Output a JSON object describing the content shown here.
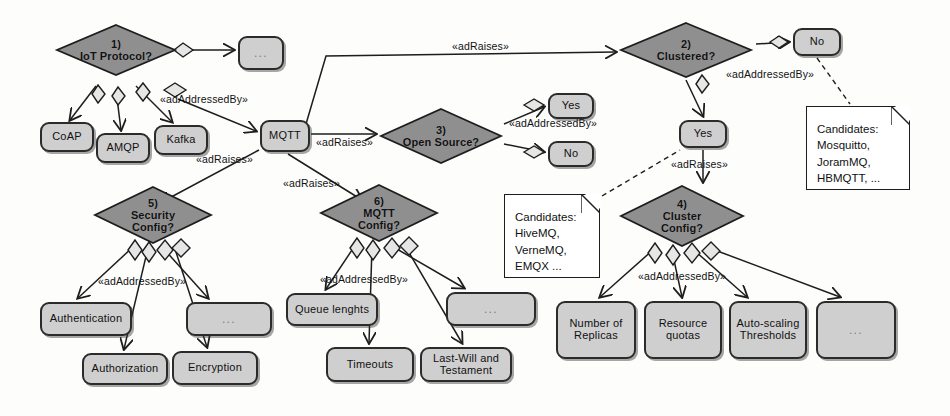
{
  "diagram": {
    "colors": {
      "node_fill": "#cfcfcf",
      "diamond_fill": "#8f8f8f",
      "note_fill": "#ffffff",
      "stroke": "#1d1d1d",
      "background": "#fdfdfc"
    },
    "decisions": [
      {
        "id": "d1",
        "number": "1)",
        "label": "IoT Protocol?",
        "x": 56,
        "y": 24,
        "w": 120,
        "h": 52
      },
      {
        "id": "d2",
        "number": "2)",
        "label": "Clustered?",
        "x": 620,
        "y": 22,
        "w": 132,
        "h": 56
      },
      {
        "id": "d3",
        "number": "3)",
        "label": "Open Source?",
        "x": 380,
        "y": 108,
        "w": 122,
        "h": 56
      },
      {
        "id": "d4",
        "number": "4)",
        "label": "Cluster\nConfig?",
        "x": 620,
        "y": 185,
        "w": 124,
        "h": 62
      },
      {
        "id": "d5",
        "number": "5)",
        "label": "Security\nConfig?",
        "x": 94,
        "y": 186,
        "w": 118,
        "h": 58
      },
      {
        "id": "d6",
        "number": "6)",
        "label": "MQTT\nConfig?",
        "x": 320,
        "y": 184,
        "w": 118,
        "h": 58
      }
    ],
    "nodes": [
      {
        "id": "n_top_dots",
        "label": "...",
        "x": 238,
        "y": 36,
        "w": 46,
        "h": 34,
        "dots": true
      },
      {
        "id": "n_coap",
        "label": "CoAP",
        "x": 40,
        "y": 122,
        "w": 54,
        "h": 30
      },
      {
        "id": "n_amqp",
        "label": "AMQP",
        "x": 96,
        "y": 133,
        "w": 54,
        "h": 30
      },
      {
        "id": "n_kafka",
        "label": "Kafka",
        "x": 154,
        "y": 125,
        "w": 54,
        "h": 30
      },
      {
        "id": "n_mqtt",
        "label": "MQTT",
        "x": 260,
        "y": 120,
        "w": 50,
        "h": 32
      },
      {
        "id": "n_os_yes",
        "label": "Yes",
        "x": 548,
        "y": 93,
        "w": 46,
        "h": 26
      },
      {
        "id": "n_os_no",
        "label": "No",
        "x": 548,
        "y": 141,
        "w": 46,
        "h": 26
      },
      {
        "id": "n_cl_no",
        "label": "No",
        "x": 793,
        "y": 28,
        "w": 48,
        "h": 28
      },
      {
        "id": "n_cl_yes",
        "label": "Yes",
        "x": 679,
        "y": 120,
        "w": 48,
        "h": 28
      },
      {
        "id": "n_auth",
        "label": "Authentication",
        "x": 40,
        "y": 302,
        "w": 92,
        "h": 34
      },
      {
        "id": "n_sec_dots",
        "label": "...",
        "x": 186,
        "y": 302,
        "w": 86,
        "h": 34,
        "dots": true
      },
      {
        "id": "n_authz",
        "label": "Authorization",
        "x": 82,
        "y": 353,
        "w": 86,
        "h": 32
      },
      {
        "id": "n_encr",
        "label": "Encryption",
        "x": 172,
        "y": 351,
        "w": 86,
        "h": 34
      },
      {
        "id": "n_queue",
        "label": "Queue lenghts",
        "x": 286,
        "y": 293,
        "w": 92,
        "h": 33
      },
      {
        "id": "n_mq_dots",
        "label": "...",
        "x": 446,
        "y": 292,
        "w": 90,
        "h": 34,
        "dots": true
      },
      {
        "id": "n_timeouts",
        "label": "Timeouts",
        "x": 326,
        "y": 347,
        "w": 88,
        "h": 35
      },
      {
        "id": "n_lwt",
        "label": "Last-Will and\nTestament",
        "x": 420,
        "y": 347,
        "w": 92,
        "h": 35
      },
      {
        "id": "n_replicas",
        "label": "Number of\nReplicas",
        "x": 556,
        "y": 301,
        "w": 80,
        "h": 58
      },
      {
        "id": "n_quotas",
        "label": "Resource\nquotas",
        "x": 644,
        "y": 301,
        "w": 78,
        "h": 58
      },
      {
        "id": "n_autoscale",
        "label": "Auto-scaling\nThresholds",
        "x": 729,
        "y": 301,
        "w": 78,
        "h": 58
      },
      {
        "id": "n_cl_dots",
        "label": "...",
        "x": 816,
        "y": 301,
        "w": 80,
        "h": 58,
        "dots": true
      }
    ],
    "notes": [
      {
        "id": "note_opensource",
        "lines": [
          "Candidates:",
          "HiveMQ,",
          "VerneMQ,",
          "EMQX ..."
        ],
        "text": "Candidates:\nHiveMQ,\nVerneMQ,\nEMQX ...",
        "x": 504,
        "y": 194,
        "w": 96,
        "h": 84
      },
      {
        "id": "note_clustered_no",
        "lines": [
          "Candidates:",
          "Mosquitto,",
          "JoramMQ,",
          "HBMQTT, ..."
        ],
        "text": "Candidates:\nMosquitto,\nJoramMQ,\nHBMQTT, ...",
        "x": 806,
        "y": 106,
        "w": 104,
        "h": 84
      }
    ],
    "edge_labels": [
      {
        "id": "lbl_ab_protocol",
        "text": "«adAddressedBy»",
        "x": 160,
        "y": 93
      },
      {
        "id": "lbl_ar_mqtt_os",
        "text": "«adRaises»",
        "x": 316,
        "y": 136
      },
      {
        "id": "lbl_ar_security",
        "text": "«adRaises»",
        "x": 196,
        "y": 153
      },
      {
        "id": "lbl_ar_mqttcfg",
        "text": "«adRaises»",
        "x": 283,
        "y": 177
      },
      {
        "id": "lbl_ar_top",
        "text": "«adRaises»",
        "x": 452,
        "y": 40
      },
      {
        "id": "lbl_ab_opensrc",
        "text": "«adAddressedBy»",
        "x": 509,
        "y": 117
      },
      {
        "id": "lbl_ab_clustered",
        "text": "«adAddressedBy»",
        "x": 726,
        "y": 68
      },
      {
        "id": "lbl_ar_cluster",
        "text": "«adRaises»",
        "x": 671,
        "y": 158
      },
      {
        "id": "lbl_ab_security",
        "text": "«adAddressedBy»",
        "x": 98,
        "y": 275
      },
      {
        "id": "lbl_ab_mqttcfg",
        "text": "«adAddressedBy»",
        "x": 320,
        "y": 273
      },
      {
        "id": "lbl_ab_clustercfg",
        "text": "«adAddressedBy»",
        "x": 638,
        "y": 270
      }
    ]
  }
}
